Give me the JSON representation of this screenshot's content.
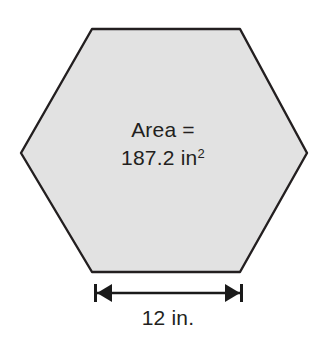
{
  "figure": {
    "type": "geometry-diagram",
    "shape": "hexagon",
    "colors": {
      "background": "#ffffff",
      "shape_fill": "#e2e2e2",
      "shape_stroke": "#231f20",
      "text": "#231f20",
      "dimension_line": "#1a1a1a"
    },
    "area_label": {
      "line1": "Area =",
      "value": "187.2",
      "unit": "in",
      "exponent": "2",
      "line2": "187.2 in²"
    },
    "dimension": {
      "label": "12 in.",
      "value": "12",
      "unit": "in.",
      "measures": "side-length-bottom-edge",
      "arrow_style": "double-headed-with-end-caps"
    },
    "geometry": {
      "vertices": [
        {
          "x": 92,
          "y": 29
        },
        {
          "x": 240,
          "y": 29
        },
        {
          "x": 307,
          "y": 153
        },
        {
          "x": 240,
          "y": 272
        },
        {
          "x": 92,
          "y": 272
        },
        {
          "x": 21,
          "y": 153
        }
      ],
      "stroke_width": 2.4
    }
  }
}
